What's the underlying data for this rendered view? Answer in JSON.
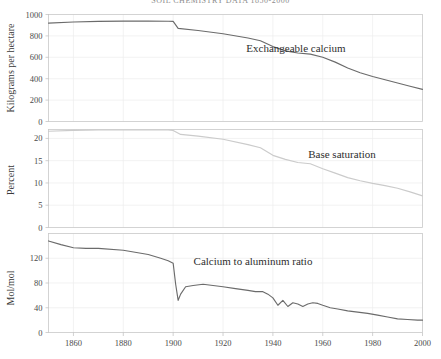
{
  "figure": {
    "title": "SOIL CHEMISTRY DATA 1850-2000",
    "width": 441,
    "height": 359
  },
  "chart_data": [
    {
      "type": "line",
      "panel": 1,
      "title": "",
      "xlabel": "",
      "ylabel": "Kilograms per hectare",
      "series_label": "Exchangeable calcium",
      "color": "#6b6b6b",
      "xlim": [
        1850,
        2000
      ],
      "ylim": [
        0,
        1000
      ],
      "yticks": [
        0,
        200,
        400,
        600,
        800,
        1000
      ],
      "xticks": [
        1860,
        1880,
        1900,
        1920,
        1940,
        1960,
        1980,
        2000
      ],
      "grid": true,
      "x": [
        1850,
        1860,
        1870,
        1880,
        1890,
        1898,
        1900,
        1902,
        1910,
        1920,
        1930,
        1935,
        1940,
        1945,
        1950,
        1955,
        1960,
        1965,
        1970,
        1975,
        1980,
        1985,
        1990,
        1995,
        2000
      ],
      "values": [
        920,
        930,
        936,
        938,
        938,
        937,
        936,
        870,
        850,
        820,
        780,
        755,
        700,
        660,
        640,
        630,
        600,
        555,
        500,
        455,
        420,
        390,
        360,
        330,
        300
      ]
    },
    {
      "type": "line",
      "panel": 2,
      "title": "",
      "xlabel": "",
      "ylabel": "Percent",
      "series_label": "Base saturation",
      "color": "#cbcbcb",
      "xlim": [
        1850,
        2000
      ],
      "ylim": [
        0,
        22
      ],
      "yticks": [
        0,
        5,
        10,
        15,
        20
      ],
      "xticks": [
        1860,
        1880,
        1900,
        1920,
        1940,
        1960,
        1980,
        2000
      ],
      "grid": true,
      "x": [
        1850,
        1860,
        1870,
        1880,
        1890,
        1898,
        1900,
        1903,
        1910,
        1920,
        1930,
        1935,
        1940,
        1945,
        1950,
        1955,
        1960,
        1965,
        1970,
        1975,
        1980,
        1985,
        1990,
        1995,
        2000
      ],
      "values": [
        21.6,
        21.8,
        21.9,
        21.9,
        21.9,
        21.9,
        21.8,
        20.9,
        20.5,
        19.8,
        18.6,
        17.9,
        16.2,
        15.3,
        14.6,
        14.3,
        13.2,
        12.2,
        11.2,
        10.5,
        9.9,
        9.4,
        8.8,
        8.0,
        7.1
      ]
    },
    {
      "type": "line",
      "panel": 3,
      "title": "",
      "xlabel": "",
      "ylabel": "Mol/mol",
      "series_label": "Calcium to aluminum ratio",
      "color": "#6b6b6b",
      "xlim": [
        1850,
        2000
      ],
      "ylim": [
        0,
        160
      ],
      "yticks": [
        0,
        40,
        80,
        120
      ],
      "xticks": [
        1860,
        1880,
        1900,
        1920,
        1940,
        1960,
        1980,
        2000
      ],
      "grid": true,
      "x": [
        1850,
        1855,
        1860,
        1865,
        1870,
        1880,
        1890,
        1895,
        1898,
        1899,
        1900,
        1901,
        1902,
        1903,
        1905,
        1908,
        1912,
        1916,
        1920,
        1925,
        1930,
        1933,
        1936,
        1938,
        1940,
        1942,
        1944,
        1946,
        1948,
        1950,
        1952,
        1954,
        1956,
        1958,
        1960,
        1963,
        1966,
        1970,
        1974,
        1978,
        1982,
        1986,
        1990,
        1994,
        1998,
        2000
      ],
      "values": [
        148,
        142,
        137,
        136,
        136,
        133,
        126,
        120,
        116,
        114,
        112,
        78,
        52,
        62,
        74,
        76,
        78,
        76,
        74,
        71,
        68,
        66,
        66,
        62,
        56,
        44,
        52,
        42,
        48,
        46,
        42,
        46,
        48,
        47,
        44,
        40,
        38,
        35,
        33,
        31,
        28,
        25,
        22,
        21,
        20,
        20
      ]
    }
  ]
}
